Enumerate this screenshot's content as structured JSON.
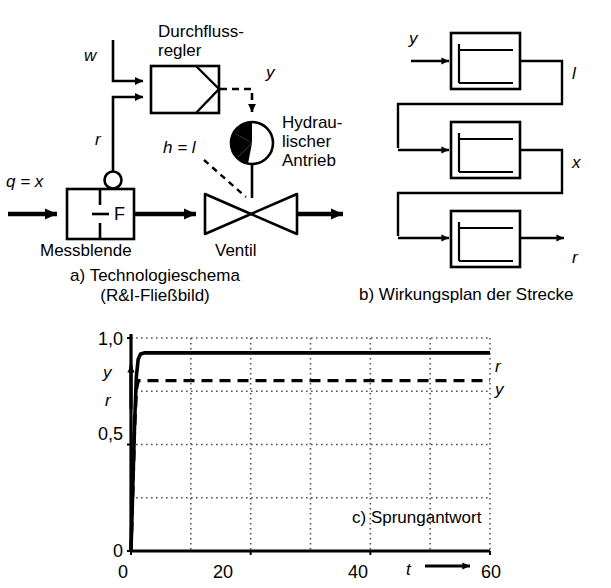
{
  "figure": {
    "language": "de",
    "panels": [
      "a",
      "b",
      "c"
    ]
  },
  "panel_a": {
    "caption_line1": "a) Technologieschema",
    "caption_line2": "(R&I-Fließbild)",
    "controller_title_line1": "Durchfluss-",
    "controller_title_line2": "regler",
    "setpoint_label": "w",
    "feedback_label": "r",
    "manipulated_label": "y",
    "stroke_label": "h = l",
    "inlet_label": "q = x",
    "orifice_label": "Messblende",
    "orifice_tag": "F",
    "valve_label": "Ventil",
    "drive_label_line1": "Hydrau-",
    "drive_label_line2": "lischer",
    "drive_label_line3": "Antrieb"
  },
  "panel_b": {
    "caption": "b) Wirkungsplan der Strecke",
    "input_label": "y",
    "blocks": [
      {
        "name": "hydraulic-drive-block",
        "output_label": "l"
      },
      {
        "name": "valve-block",
        "output_label": "x"
      },
      {
        "name": "orifice-block",
        "output_label": "r"
      }
    ]
  },
  "panel_c": {
    "caption": "c) Sprungantwort"
  },
  "chart_data": {
    "type": "line",
    "title": "c) Sprungantwort",
    "xlabel": "t",
    "ylabel": "y\nr",
    "xlim": [
      0,
      60
    ],
    "ylim": [
      0,
      1.0
    ],
    "xticks": [
      0,
      20,
      40,
      60
    ],
    "xtick_labels": [
      "0",
      "20",
      "40",
      "60"
    ],
    "yticks": [
      0,
      0.5,
      1.0
    ],
    "ytick_labels": [
      "0",
      "0,5",
      "1,0"
    ],
    "xgrid_minor": [
      10,
      20,
      30,
      40,
      50,
      60
    ],
    "ygrid_minor": [
      0.25,
      0.5,
      0.75,
      0.8,
      1.0
    ],
    "grid": true,
    "grid_style": "dotted",
    "legend_position": "right-inline",
    "series": [
      {
        "name": "r",
        "label": "r",
        "style": "solid",
        "steady_state": 0.93,
        "rise_time": 1.2,
        "x": [
          0,
          0.3,
          0.6,
          0.9,
          1.2,
          1.6,
          2.2,
          3,
          6,
          10,
          20,
          30,
          40,
          50,
          60
        ],
        "values": [
          0,
          0.3,
          0.6,
          0.82,
          0.9,
          0.925,
          0.93,
          0.93,
          0.93,
          0.93,
          0.93,
          0.93,
          0.93,
          0.93,
          0.93
        ]
      },
      {
        "name": "y",
        "label": "y",
        "style": "dashed",
        "steady_state": 0.8,
        "rise_time": 1.0,
        "x": [
          0,
          0.3,
          0.6,
          0.9,
          1.2,
          2,
          5,
          10,
          20,
          30,
          40,
          50,
          60
        ],
        "values": [
          0,
          0.28,
          0.58,
          0.76,
          0.8,
          0.8,
          0.8,
          0.8,
          0.8,
          0.8,
          0.8,
          0.8,
          0.8
        ]
      }
    ]
  },
  "colors": {
    "ink": "#000000",
    "grid": "#555555",
    "background": "#ffffff"
  }
}
